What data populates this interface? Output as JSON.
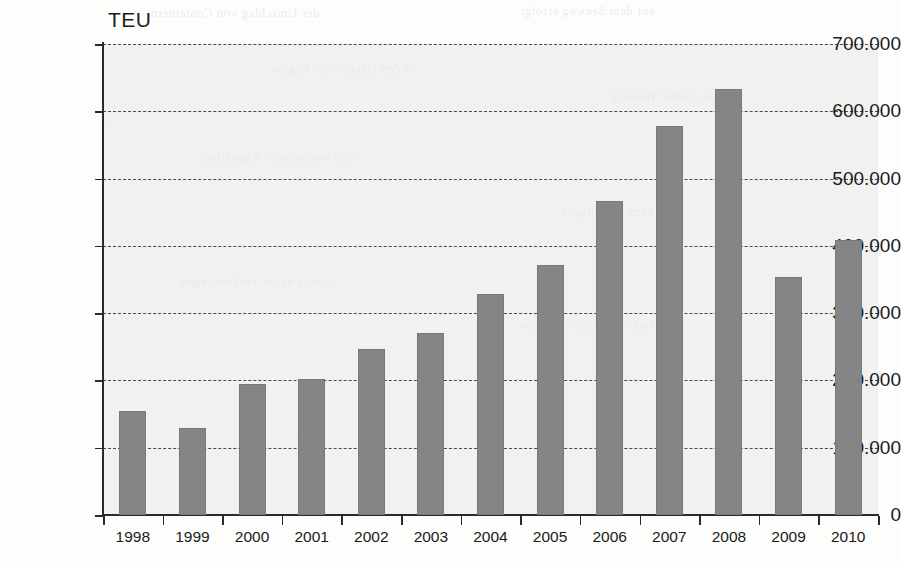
{
  "chart_data": {
    "type": "bar",
    "title": "",
    "subtitle": "",
    "unit_label": "TEU",
    "xlabel": "",
    "ylabel": "TEU",
    "categories": [
      "1998",
      "1999",
      "2000",
      "2001",
      "2002",
      "2003",
      "2004",
      "2005",
      "2006",
      "2007",
      "2008",
      "2009",
      "2010"
    ],
    "values": [
      155000,
      130000,
      195000,
      202000,
      246000,
      270000,
      329000,
      371000,
      467000,
      578000,
      633000,
      354000,
      408000
    ],
    "ylim": [
      0,
      700000
    ],
    "ytick_values": [
      0,
      100000,
      200000,
      300000,
      400000,
      500000,
      600000,
      700000
    ],
    "ytick_labels": [
      "0",
      "100.000",
      "200.000",
      "300.000",
      "400.000",
      "500.000",
      "600.000",
      "700.000"
    ],
    "grid": true,
    "grid_style": "dashed-horizontal",
    "legend": null,
    "legend_position": "none",
    "series": [
      {
        "name": "TEU",
        "color": "#858585",
        "values": [
          155000,
          130000,
          195000,
          202000,
          246000,
          270000,
          329000,
          371000,
          467000,
          578000,
          633000,
          354000,
          408000
        ]
      }
    ],
    "annotations": []
  },
  "colors": {
    "bar_fill": "#858585",
    "axis": "#2a2a2a",
    "gridline": "#4a4a4a",
    "plot_background": "#e8e8e6",
    "text": "#1b1b1b"
  },
  "background_artifacts": {
    "description": "faint mirrored bleed-through text from reverse page of scanned document",
    "lines": [
      "der Umschlag von Containern",
      "auf dem Seeweg erfolgt",
      "in den Haefen der Region",
      "mit steigender Tendenz",
      "und wachsender Kapazitaet",
      "der Terminalanlagen",
      "sowie neuer Verbindungen",
      "im internationalen Verkehr"
    ]
  }
}
